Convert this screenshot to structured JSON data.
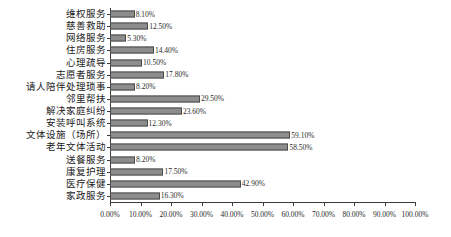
{
  "chart_data": {
    "type": "bar",
    "orientation": "horizontal",
    "title": "",
    "subtitle": "",
    "xlabel": "",
    "ylabel": "",
    "xlim": [
      0,
      100
    ],
    "xtick_labels": [
      "0.00%",
      "10.00%",
      "20.00%",
      "30.00%",
      "40.00%",
      "50.00%",
      "60.00%",
      "70.00%",
      "80.00%",
      "90.00%",
      "100.00%"
    ],
    "xticks": [
      0,
      10,
      20,
      30,
      40,
      50,
      60,
      70,
      80,
      90,
      100
    ],
    "grid": false,
    "legend": null,
    "bar_color": "#8d8d8d",
    "bar_border_color": "#4a4a4a",
    "axis_color": "#3b3b3b",
    "categories": [
      "维权服务",
      "慈善救助",
      "网络服务",
      "住房服务",
      "心理疏导",
      "志愿者服务",
      "请人陪伴处理琐事",
      "邻里帮扶",
      "解决家庭纠纷",
      "安装呼叫系统",
      "文体设施（场所）",
      "老年文体活动",
      "送餐服务",
      "康复护理",
      "医疗保健",
      "家政服务"
    ],
    "values": [
      8.1,
      12.5,
      5.3,
      14.4,
      10.5,
      17.8,
      8.2,
      29.5,
      23.6,
      12.3,
      59.1,
      58.5,
      8.2,
      17.5,
      42.9,
      16.3
    ],
    "value_labels": [
      "8.10%",
      "12.50%",
      "5.30%",
      "14.40%",
      "10.50%",
      "17.80%",
      "8.20%",
      "29.50%",
      "23.60%",
      "12.30%",
      "59.10%",
      "58.50%",
      "8.20%",
      "17.50%",
      "42.90%",
      "16.30%"
    ]
  }
}
